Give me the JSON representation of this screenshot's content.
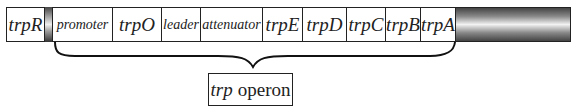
{
  "diagram": {
    "segments": [
      {
        "id": "trpR",
        "label": "trpR"
      },
      {
        "id": "promoter",
        "label": "promoter"
      },
      {
        "id": "trpO",
        "label": "trpO"
      },
      {
        "id": "leader",
        "label": "leader"
      },
      {
        "id": "attenuator",
        "label": "attenuator"
      },
      {
        "id": "trpE",
        "label": "trpE"
      },
      {
        "id": "trpD",
        "label": "trpD"
      },
      {
        "id": "trpC",
        "label": "trpC"
      },
      {
        "id": "trpB",
        "label": "trpB"
      },
      {
        "id": "trpA",
        "label": "trpA"
      }
    ],
    "operon_label": {
      "gene": "trp",
      "word": "operon"
    }
  }
}
